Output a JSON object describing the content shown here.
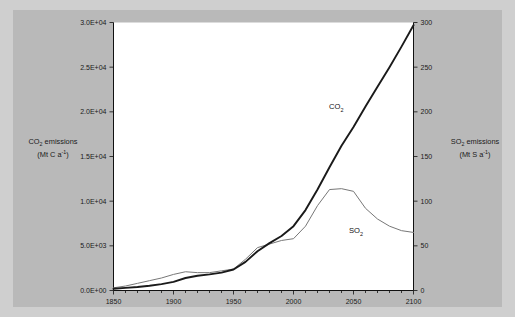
{
  "figure": {
    "background_color": "#b9b9b9",
    "plot_background_color": "#ffffff",
    "border_color": "#cfcfcf"
  },
  "labels": {
    "left_axis_line1": "CO",
    "left_axis_line1_sub": "2",
    "left_axis_line1_rest": " emissions",
    "left_axis_line2_pre": "(Mt C a",
    "left_axis_line2_sup": "-1",
    "left_axis_line2_post": ")",
    "right_axis_line1": "SO",
    "right_axis_line1_sub": "2",
    "right_axis_line1_rest": " emissions",
    "right_axis_line2_pre": "(Mt S a",
    "right_axis_line2_sup": "-1",
    "right_axis_line2_post": ")",
    "co2_series": "CO",
    "co2_series_sub": "2",
    "so2_series": "SO",
    "so2_series_sub": "2"
  },
  "chart_data": {
    "type": "line",
    "title": "",
    "xlabel": "",
    "ylabel": "CO2 emissions (Mt C a-1)",
    "y2label": "SO2 emissions (Mt S a-1)",
    "xlim": [
      1850,
      2100
    ],
    "ylim": [
      0,
      30000
    ],
    "y2lim": [
      0,
      300
    ],
    "grid": false,
    "legend": "inline-annotation",
    "xticks": [
      1850,
      1900,
      1950,
      2000,
      2050,
      2100
    ],
    "xticklabels": [
      "1850",
      "1900",
      "1950",
      "2000",
      "2050",
      "2100"
    ],
    "xminortick_interval": 10,
    "yticks": [
      0,
      5000,
      10000,
      15000,
      20000,
      25000,
      30000
    ],
    "yticklabels": [
      "0.0E+00",
      "5.0E+03",
      "1.0E+04",
      "1.5E+04",
      "2.0E+04",
      "2.5E+04",
      "3.0E+04"
    ],
    "y2ticks": [
      0,
      50,
      100,
      150,
      200,
      250,
      300
    ],
    "y2ticklabels": [
      "0",
      "50",
      "100",
      "150",
      "200",
      "250",
      "300"
    ],
    "series": [
      {
        "name": "CO2",
        "axis": "left",
        "color": "#1a1a1a",
        "width": 1.9,
        "x": [
          1850,
          1860,
          1870,
          1880,
          1890,
          1900,
          1910,
          1920,
          1930,
          1940,
          1950,
          1960,
          1970,
          1980,
          1990,
          2000,
          2010,
          2020,
          2030,
          2040,
          2050,
          2060,
          2070,
          2080,
          2090,
          2100
        ],
        "values": [
          200,
          290,
          390,
          530,
          720,
          960,
          1400,
          1650,
          1800,
          2000,
          2350,
          3200,
          4400,
          5300,
          6100,
          7200,
          9000,
          11300,
          13800,
          16200,
          18300,
          20600,
          22800,
          25000,
          27300,
          29700
        ]
      },
      {
        "name": "SO2",
        "axis": "right",
        "color": "#777777",
        "width": 1.0,
        "x": [
          1850,
          1860,
          1870,
          1880,
          1890,
          1900,
          1910,
          1920,
          1930,
          1940,
          1950,
          1960,
          1970,
          1980,
          1990,
          2000,
          2010,
          2020,
          2030,
          2040,
          2050,
          2060,
          2070,
          2080,
          2090,
          2100
        ],
        "values": [
          3,
          5,
          8,
          11,
          14,
          18,
          21,
          20,
          20,
          22,
          24,
          35,
          48,
          52,
          56,
          58,
          72,
          95,
          113,
          114,
          111,
          92,
          80,
          72,
          67,
          65
        ]
      }
    ]
  }
}
